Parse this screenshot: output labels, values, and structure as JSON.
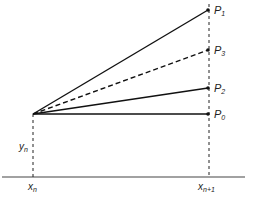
{
  "diagram": {
    "type": "geometric-construction",
    "colors": {
      "ink": "#222222",
      "background": "#ffffff"
    },
    "origin": {
      "x": 33,
      "y": 114
    },
    "baseline": {
      "y": 177,
      "x1": 2,
      "x2": 245
    },
    "right_guide_x": 209,
    "points": [
      {
        "id": "P1",
        "label": "P",
        "sub": "1",
        "y": 10,
        "style": "solid"
      },
      {
        "id": "P3",
        "label": "P",
        "sub": "3",
        "y": 50,
        "style": "dashed"
      },
      {
        "id": "P2",
        "label": "P",
        "sub": "2",
        "y": 88,
        "style": "solid"
      },
      {
        "id": "P0",
        "label": "P",
        "sub": "0",
        "y": 114,
        "style": "solid"
      }
    ],
    "axis_labels": {
      "yn": {
        "main": "y",
        "sub": "n"
      },
      "xn": {
        "main": "x",
        "sub": "n"
      },
      "xn1": {
        "main": "x",
        "sub": "n+1"
      }
    }
  }
}
